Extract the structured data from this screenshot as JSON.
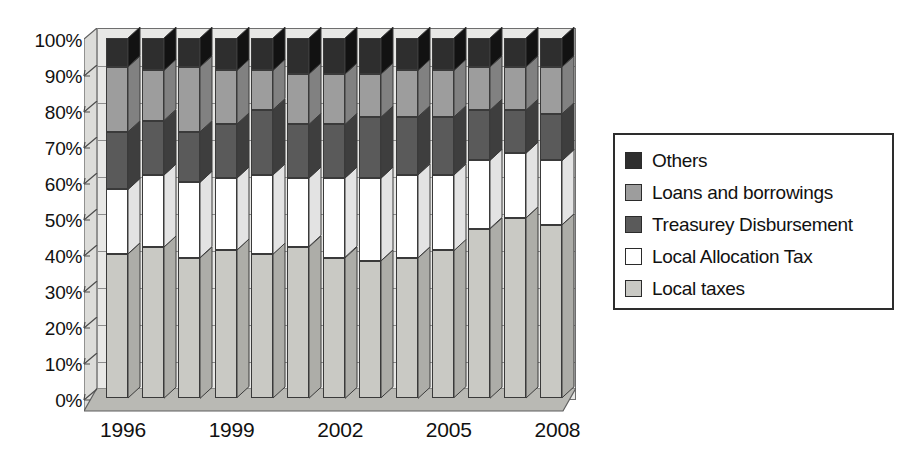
{
  "chart_data": {
    "type": "bar",
    "subtype": "stacked-100-percent-3d",
    "title": "",
    "xlabel": "",
    "ylabel": "",
    "ylim": [
      0,
      100
    ],
    "y_tick_labels": [
      "100%",
      "90%",
      "80%",
      "70%",
      "60%",
      "50%",
      "40%",
      "30%",
      "20%",
      "10%",
      "0%"
    ],
    "y_tick_values": [
      100,
      90,
      80,
      70,
      60,
      50,
      40,
      30,
      20,
      10,
      0
    ],
    "grid": true,
    "legend_position": "right",
    "categories": [
      "1996",
      "1997",
      "1998",
      "1999",
      "2000",
      "2001",
      "2002",
      "2003",
      "2004",
      "2005",
      "2006",
      "2007",
      "2008"
    ],
    "x_tick_labels": [
      "1996",
      "1999",
      "2002",
      "2005",
      "2008"
    ],
    "x_tick_category_index": [
      0,
      3,
      6,
      9,
      12
    ],
    "stack_order_bottom_to_top": [
      "Local taxes",
      "Local Allocation Tax",
      "Treasurey Disbursement",
      "Loans and borrowings",
      "Others"
    ],
    "series": [
      {
        "name": "Local taxes",
        "color": "#c9c9c4",
        "values": [
          40,
          42,
          39,
          41,
          40,
          42,
          39,
          38,
          39,
          41,
          47,
          50,
          48
        ]
      },
      {
        "name": "Local Allocation Tax",
        "color": "#ffffff",
        "values": [
          18,
          20,
          21,
          20,
          22,
          19,
          22,
          23,
          23,
          21,
          19,
          18,
          18
        ]
      },
      {
        "name": "Treasurey Disbursement",
        "color": "#5a5a5a",
        "values": [
          16,
          15,
          14,
          15,
          18,
          15,
          15,
          17,
          16,
          16,
          14,
          12,
          13
        ]
      },
      {
        "name": "Loans and borrowings",
        "color": "#9d9d9d",
        "values": [
          18,
          14,
          18,
          15,
          11,
          14,
          14,
          12,
          13,
          13,
          12,
          12,
          13
        ]
      },
      {
        "name": "Others",
        "color": "#2e2e2e",
        "values": [
          8,
          9,
          8,
          9,
          9,
          10,
          10,
          10,
          9,
          9,
          8,
          8,
          8
        ]
      }
    ]
  },
  "legend": {
    "items": [
      {
        "label": "Others",
        "color": "#2e2e2e"
      },
      {
        "label": "Loans and borrowings",
        "color": "#9d9d9d"
      },
      {
        "label": "Treasurey Disbursement",
        "color": "#5a5a5a"
      },
      {
        "label": "Local Allocation Tax",
        "color": "#ffffff"
      },
      {
        "label": "Local taxes",
        "color": "#c9c9c4"
      }
    ]
  },
  "palette": {
    "background": "#ffffff",
    "wall": "#e8e8e6",
    "wall_left": "#dcdcd9",
    "floor": "#b9b9b4",
    "gridline": "#8d8d8d",
    "frame": "#6e6e6e",
    "text": "#111111"
  }
}
